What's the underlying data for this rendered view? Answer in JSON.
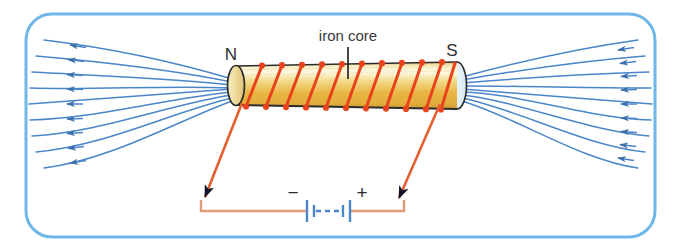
{
  "figure": {
    "border_color": "#6fb7e8",
    "background_color": "#ffffff"
  },
  "labels": {
    "north_pole": "N",
    "south_pole": "S",
    "core": "iron core",
    "battery_negative": "−",
    "battery_positive": "+"
  },
  "colors": {
    "field_line": "#4a86c8",
    "coil_wire": "#e8431c",
    "lead_wire": "#e2602f",
    "battery_wire": "#e09b79",
    "battery_symbol": "#4a86c8",
    "core_light": "#fdf6d8",
    "core_gold": "#e9b745",
    "core_edge": "#3d3320",
    "arrow_head": "#1a1a2e",
    "pointer_line": "#1a1a1a"
  },
  "diagram_data": {
    "type": "physics-schematic",
    "components": [
      {
        "name": "solenoid-core",
        "label": "iron core",
        "shape": "cylinder",
        "orientation": "horizontal"
      },
      {
        "name": "coil-winding",
        "turns": 11,
        "color": "#e8431c"
      },
      {
        "name": "north-pole",
        "label": "N",
        "side": "left"
      },
      {
        "name": "south-pole",
        "label": "S",
        "side": "right"
      },
      {
        "name": "battery",
        "cells": 2,
        "terminals": [
          "−",
          "+"
        ]
      },
      {
        "name": "field-lines-left",
        "count": 9,
        "arrow_direction": "left"
      },
      {
        "name": "field-lines-right",
        "count": 9,
        "arrow_direction": "left"
      },
      {
        "name": "lead-wire-left",
        "arrow_direction": "down-left"
      },
      {
        "name": "lead-wire-right",
        "arrow_direction": "down-right"
      }
    ],
    "field_direction": "out of N pole, into S pole",
    "current_direction": "from + terminal through coil to − terminal"
  }
}
